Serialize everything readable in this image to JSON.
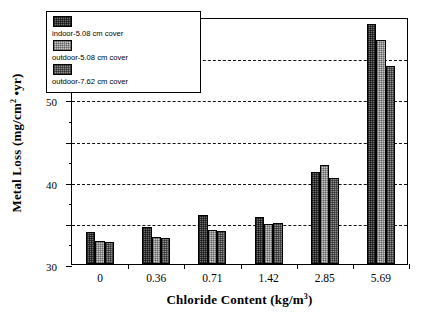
{
  "chart_data": {
    "type": "bar",
    "title": "",
    "xlabel": "Chloride Content (kg/m3)",
    "xlabel_base": "Chloride Content (kg/m",
    "xlabel_sup": "3",
    "xlabel_tail": ")",
    "ylabel": "Metal Loss (mg/cm2 •yr)",
    "ylabel_base": "Metal Loss (mg/cm",
    "ylabel_sup": "2",
    "ylabel_tail": " •yr)",
    "categories": [
      "0",
      "0.36",
      "0.71",
      "1.42",
      "2.85",
      "5.69"
    ],
    "ylim": [
      0,
      60
    ],
    "ytick_labels": [
      "0",
      "10",
      "20",
      "30",
      "40",
      "50",
      "60"
    ],
    "ytick_values": [
      0,
      10,
      20,
      30,
      40,
      50,
      60
    ],
    "yminor_values": [
      5,
      15,
      25,
      35,
      45,
      55
    ],
    "grid": "horizontal-dashed",
    "legend_position": "upper-left-inside",
    "series": [
      {
        "name": "indoor-5.08 cm cover",
        "pattern": "pat-dark",
        "color": "#6f6f6f",
        "values": [
          7.7,
          9.0,
          11.9,
          11.4,
          22.4,
          58.4
        ]
      },
      {
        "name": "outdoor-5.08 cm cover",
        "pattern": "pat-light",
        "color": "#c6c6c6",
        "values": [
          5.5,
          6.5,
          8.2,
          9.8,
          24.0,
          54.3
        ]
      },
      {
        "name": "outdoor-7.62 cm cover",
        "pattern": "pat-med",
        "color": "#8e8e8e",
        "values": [
          5.3,
          6.2,
          8.1,
          10.0,
          21.0,
          48.0
        ]
      }
    ]
  }
}
